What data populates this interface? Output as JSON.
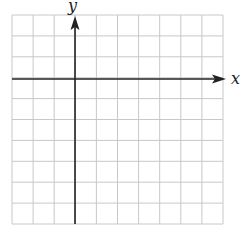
{
  "diagram": {
    "type": "coordinate-plane",
    "grid": {
      "columns": 10,
      "rows": 10,
      "left": 12,
      "top": 15,
      "right": 223,
      "bottom": 224,
      "line_color": "#c8c8c8"
    },
    "axes": {
      "color": "#222222",
      "x_axis": {
        "label": "x",
        "row_index": 3
      },
      "y_axis": {
        "label": "y",
        "column_index": 3
      }
    }
  }
}
